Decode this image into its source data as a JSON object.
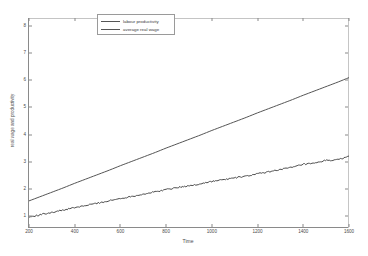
{
  "chart_data": {
    "type": "line",
    "title": "",
    "xlabel": "Time",
    "ylabel": "real wage and productivity",
    "xlim": [
      200,
      1600
    ],
    "ylim": [
      0.55,
      8.3
    ],
    "xticks": [
      200,
      400,
      600,
      800,
      1000,
      1200,
      1400,
      1600
    ],
    "yticks": [
      1,
      2,
      3,
      4,
      5,
      6,
      7,
      8
    ],
    "grid": false,
    "legend_position": "top-center",
    "series": [
      {
        "name": "labour productivity",
        "color": "#555555",
        "x": [
          200,
          250,
          300,
          350,
          400,
          450,
          500,
          550,
          600,
          650,
          700,
          750,
          800,
          850,
          900,
          950,
          1000,
          1050,
          1100,
          1150,
          1200,
          1250,
          1300,
          1350,
          1400,
          1450,
          1500,
          1550,
          1600
        ],
        "values": [
          1.55,
          1.71,
          1.87,
          2.03,
          2.2,
          2.36,
          2.52,
          2.68,
          2.85,
          3.01,
          3.17,
          3.33,
          3.5,
          3.66,
          3.82,
          3.98,
          4.15,
          4.31,
          4.47,
          4.63,
          4.8,
          4.96,
          5.12,
          5.28,
          5.45,
          5.61,
          5.77,
          5.93,
          6.1
        ]
      },
      {
        "name": "average real wage",
        "color": "#4a4a4a",
        "x": [
          200,
          250,
          300,
          350,
          400,
          450,
          500,
          550,
          600,
          650,
          700,
          750,
          800,
          850,
          900,
          950,
          1000,
          1050,
          1100,
          1150,
          1200,
          1250,
          1300,
          1350,
          1400,
          1450,
          1500,
          1550,
          1600
        ],
        "values": [
          0.95,
          1.04,
          1.13,
          1.21,
          1.3,
          1.38,
          1.47,
          1.55,
          1.64,
          1.72,
          1.8,
          1.88,
          1.97,
          2.05,
          2.1,
          2.18,
          2.27,
          2.33,
          2.4,
          2.46,
          2.55,
          2.62,
          2.72,
          2.78,
          2.9,
          2.93,
          3.05,
          3.06,
          3.2
        ]
      }
    ]
  },
  "legend": {
    "items": [
      {
        "label": "labour productivity"
      },
      {
        "label": "average real wage"
      }
    ]
  },
  "axes": {
    "xlabel": "Time",
    "ylabel": "real wage and productivity"
  }
}
